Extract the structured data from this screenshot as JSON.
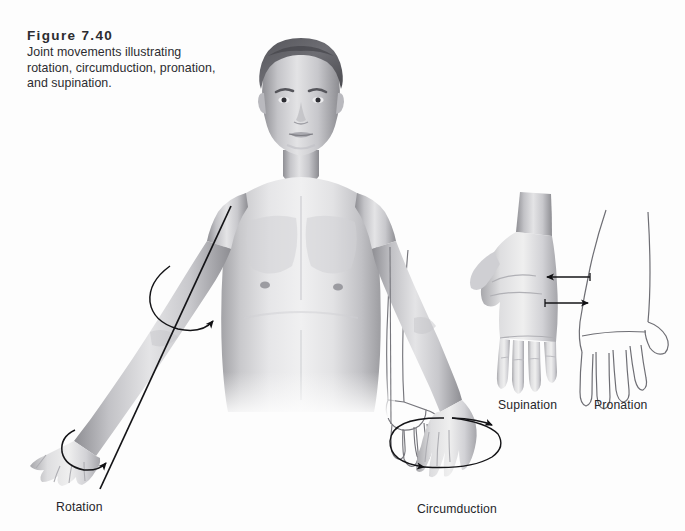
{
  "figure": {
    "number_label": "Figure 7.40",
    "caption": "Joint movements illustrating rotation, circumduction, pronation, and supination.",
    "running_head": "",
    "background_color": "#fdfdfd",
    "ink_color": "#1a1a1a",
    "outline_color": "#6b6b70",
    "label_color": "#26262a"
  },
  "labels": {
    "rotation": "Rotation",
    "circumduction": "Circumduction",
    "supination": "Supination",
    "pronation": "Pronation"
  },
  "illustration": {
    "subject": "anterior view of a standing human figure, grayscale airbrush rendering, arms abducted",
    "panels": [
      {
        "name": "rotation",
        "description": "Subject's left arm extended laterally with a straight axis line drawn from the shoulder through the arm to the hand, and two circular arrows indicating rotation about that axis",
        "label": "Rotation",
        "arrow_count": 2
      },
      {
        "name": "circumduction",
        "description": "Subject's right forearm shown in two positions, shaded and ghosted outline, with an ellipse and two arrowheads tracing the cone swept by the hand",
        "label": "Circumduction",
        "arrow_count": 2
      },
      {
        "name": "supination-pronation",
        "description": "Two hands side by side: the left is shaded with palm facing up (supinated) and the right is a line drawing with palm facing down (pronated), joined by two horizontal arrows",
        "label_left": "Supination",
        "label_right": "Pronation",
        "arrow_count": 2
      }
    ]
  }
}
